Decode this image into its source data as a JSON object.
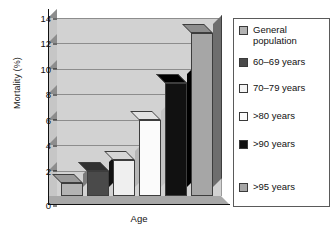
{
  "chart_data": {
    "type": "bar",
    "title": "",
    "xlabel": "Age",
    "ylabel": "Mortality (%)",
    "ylim": [
      0,
      14
    ],
    "yticks": [
      0,
      2,
      4,
      6,
      8,
      10,
      12,
      14
    ],
    "grid": true,
    "legend_position": "right",
    "categories": [
      "General population",
      "60–69 years",
      "70–79 years",
      ">80 years",
      ">90 years",
      ">95 years"
    ],
    "values": [
      1.0,
      2.0,
      2.8,
      6.0,
      8.9,
      12.8
    ],
    "colors": [
      "#b3b3b3",
      "#4a4a4a",
      "#efefef",
      "#fbfbfb",
      "#111111",
      "#a6a6a6"
    ]
  },
  "axes": {
    "y_title": "Mortality (%)",
    "x_title": "Age",
    "y_tick_labels": [
      "14",
      "12",
      "10",
      "8",
      "6",
      "4",
      "2",
      "0"
    ]
  },
  "legend": {
    "items": [
      {
        "label": "General\npopulation",
        "color": "#b3b3b3"
      },
      {
        "label": "60–69 years",
        "color": "#4a4a4a"
      },
      {
        "label": "70–79 years",
        "color": "#f4f4f4"
      },
      {
        "label": ">80 years",
        "color": "#fcfcfc"
      },
      {
        "label": ">90 years",
        "color": "#111111"
      },
      {
        "label": ">95 years",
        "color": "#a6a6a6"
      }
    ]
  }
}
